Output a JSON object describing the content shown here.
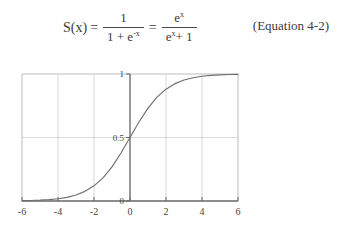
{
  "equation": {
    "lhs": "S(x)",
    "relation_1": "=",
    "fraction_1": {
      "numerator": "1",
      "denominator_base": "1 + e",
      "denominator_exponent": "-x"
    },
    "relation_2": "=",
    "fraction_2": {
      "numerator_base": "e",
      "numerator_exponent": "x",
      "denominator_base_1": "e",
      "denominator_exponent_1": "x",
      "denominator_tail": "+ 1"
    },
    "label": "(Equation 4-2)"
  },
  "chart_data": {
    "type": "line",
    "title": "",
    "xlabel": "",
    "ylabel": "",
    "xlim": [
      -6,
      6
    ],
    "ylim": [
      0,
      1
    ],
    "grid": true,
    "legend": null,
    "x_ticks": [
      -6,
      -4,
      -2,
      0,
      2,
      4,
      6
    ],
    "x_tick_labels": [
      "-6",
      "-4",
      "-2",
      "0",
      "2",
      "4",
      "6"
    ],
    "y_ticks": [
      0,
      0.5,
      1
    ],
    "y_tick_labels": [
      "0",
      "0.5",
      "1"
    ],
    "series": [
      {
        "name": "sigmoid",
        "color": "#6f6f6f",
        "x": [
          -6,
          -5.5,
          -5,
          -4.5,
          -4,
          -3.5,
          -3,
          -2.5,
          -2,
          -1.5,
          -1,
          -0.5,
          0,
          0.5,
          1,
          1.5,
          2,
          2.5,
          3,
          3.5,
          4,
          4.5,
          5,
          5.5,
          6
        ],
        "values": [
          0.0025,
          0.0041,
          0.0067,
          0.011,
          0.018,
          0.029,
          0.0474,
          0.0759,
          0.1192,
          0.1824,
          0.2689,
          0.3775,
          0.5,
          0.6225,
          0.7311,
          0.8176,
          0.8808,
          0.9241,
          0.9526,
          0.9707,
          0.982,
          0.989,
          0.9933,
          0.9959,
          0.9975
        ]
      }
    ],
    "colors": {
      "curve": "#6f6f6f",
      "grid": "#c9c9c9",
      "axis": "#6d6d6d",
      "text": "#3f3f3f",
      "background": "#ffffff"
    }
  }
}
